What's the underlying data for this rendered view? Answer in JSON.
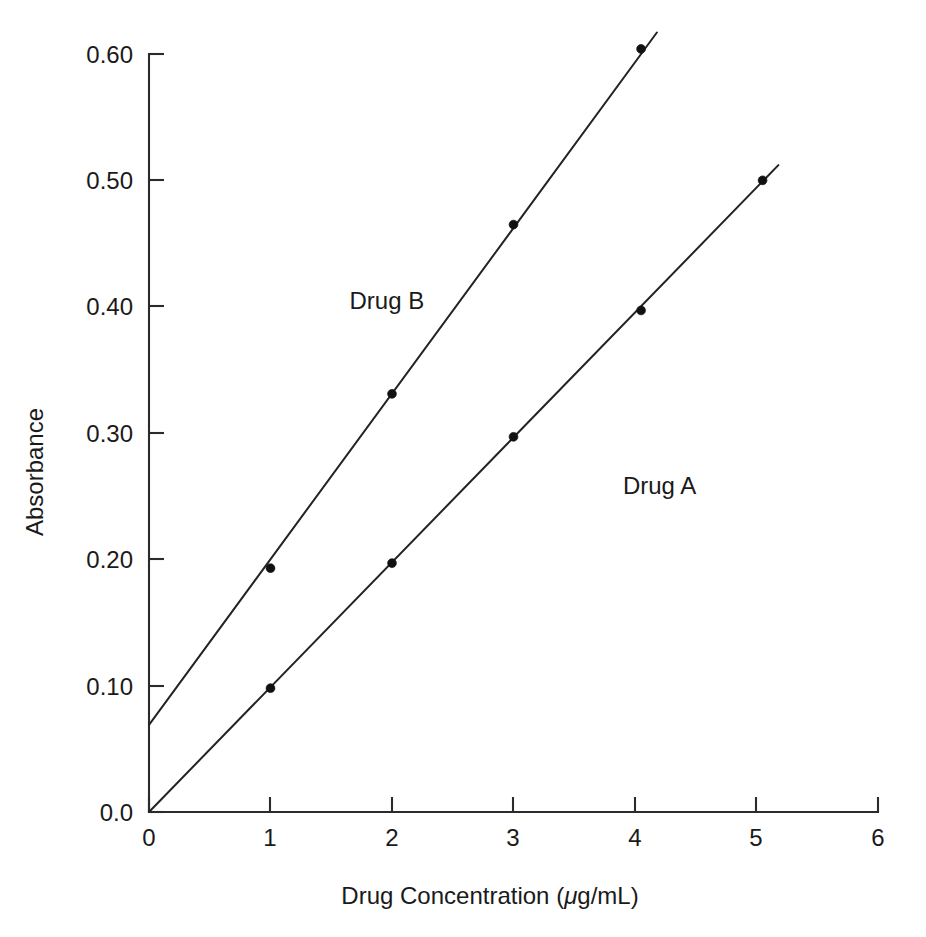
{
  "chart_data": {
    "type": "line",
    "title": "",
    "subtitle": "",
    "xlabel": "Drug Concentration (μg/mL)",
    "ylabel": "Absorbance",
    "xlim": [
      0,
      6
    ],
    "ylim": [
      0.0,
      0.62
    ],
    "grid": false,
    "legend_position": "inline-annotation",
    "x_ticks": [
      0,
      1,
      2,
      3,
      4,
      5,
      6
    ],
    "x_tick_labels": [
      "0",
      "1",
      "2",
      "3",
      "4",
      "5",
      "6"
    ],
    "y_ticks": [
      0.0,
      0.1,
      0.2,
      0.3,
      0.4,
      0.5,
      0.6
    ],
    "y_tick_labels": [
      "0.0",
      "0.10",
      "0.20",
      "0.30",
      "0.40",
      "0.50",
      "0.60"
    ],
    "series": [
      {
        "name": "Drug A",
        "label_x": 3.9,
        "label_y": 0.252,
        "marker": "filled-circle",
        "line_start": {
          "x": 0.0,
          "y": 0.0
        },
        "line_end": {
          "x": 5.18,
          "y": 0.512
        },
        "x": [
          0.0,
          1.0,
          2.0,
          3.0,
          4.05,
          5.05
        ],
        "y": [
          0.0,
          0.098,
          0.197,
          0.297,
          0.397,
          0.5
        ],
        "markers_x": [
          1.0,
          2.0,
          3.0,
          4.05,
          5.05
        ],
        "markers_y": [
          0.098,
          0.197,
          0.297,
          0.397,
          0.5
        ]
      },
      {
        "name": "Drug B",
        "label_x": 1.65,
        "label_y": 0.398,
        "marker": "filled-circle",
        "line_start": {
          "x": 0.0,
          "y": 0.069
        },
        "line_end": {
          "x": 4.18,
          "y": 0.617
        },
        "x": [
          0.0,
          1.0,
          2.0,
          3.0,
          4.05
        ],
        "y": [
          0.069,
          0.193,
          0.331,
          0.465,
          0.604
        ],
        "markers_x": [
          1.0,
          2.0,
          3.0,
          4.05
        ],
        "markers_y": [
          0.193,
          0.331,
          0.465,
          0.604
        ]
      }
    ]
  },
  "axes": {
    "x_label": "Drug Concentration (μg/mL)",
    "x_label_prefix": "Drug Concentration (",
    "x_label_mu": "μ",
    "x_label_suffix": "g/mL)",
    "y_label": "Absorbance"
  },
  "ticks": {
    "y": [
      {
        "value": 0.6,
        "label": "0.60"
      },
      {
        "value": 0.5,
        "label": "0.50"
      },
      {
        "value": 0.4,
        "label": "0.40"
      },
      {
        "value": 0.3,
        "label": "0.30"
      },
      {
        "value": 0.2,
        "label": "0.20"
      },
      {
        "value": 0.1,
        "label": "0.10"
      },
      {
        "value": 0.0,
        "label": "0.0"
      }
    ],
    "x": [
      {
        "value": 0,
        "label": "0"
      },
      {
        "value": 1,
        "label": "1"
      },
      {
        "value": 2,
        "label": "2"
      },
      {
        "value": 3,
        "label": "3"
      },
      {
        "value": 4,
        "label": "4"
      },
      {
        "value": 5,
        "label": "5"
      },
      {
        "value": 6,
        "label": "6"
      }
    ]
  },
  "annotations": [
    {
      "name": "series-label-drug-b",
      "text": "Drug B"
    },
    {
      "name": "series-label-drug-a",
      "text": "Drug A"
    }
  ],
  "colors": {
    "background": "#ffffff",
    "axis": "#2b2b2b",
    "line": "#232323",
    "marker": "#111111",
    "text": "#1a1a1a"
  }
}
